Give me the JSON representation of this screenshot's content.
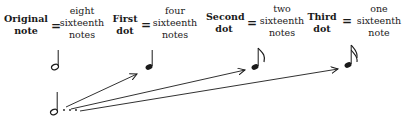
{
  "diagram": {
    "terms": [
      {
        "id": "original-note",
        "label_line1": "Original",
        "label_line2": "note",
        "equals": "=",
        "value_line1": "eight",
        "value_line2": "sixteenth",
        "value_line3": "notes"
      },
      {
        "id": "first-dot",
        "label_line1": "First",
        "label_line2": "dot",
        "equals": "=",
        "value_line1": "four",
        "value_line2": "sixteenth",
        "value_line3": "notes"
      },
      {
        "id": "second-dot",
        "label_line1": "Second",
        "label_line2": "dot",
        "equals": "=",
        "value_line1": "two",
        "value_line2": "sixteenth",
        "value_line3": "notes"
      },
      {
        "id": "third-dot",
        "label_line1": "Third",
        "label_line2": "dot",
        "equals": "=",
        "value_line1": "one",
        "value_line2": "sixteenth",
        "value_line3": "note"
      }
    ],
    "notes": [
      {
        "id": "half-note",
        "type": "half-note"
      },
      {
        "id": "quarter-note",
        "type": "quarter-note"
      },
      {
        "id": "eighth-note",
        "type": "eighth-note"
      },
      {
        "id": "sixteenth-note",
        "type": "sixteenth-note"
      },
      {
        "id": "triple-dotted-half-note",
        "type": "half-note-with-three-dots"
      }
    ],
    "arrows": [
      {
        "from": "dot-1",
        "to": "quarter-note"
      },
      {
        "from": "dot-2",
        "to": "eighth-note"
      },
      {
        "from": "dot-3",
        "to": "sixteenth-note"
      }
    ]
  }
}
